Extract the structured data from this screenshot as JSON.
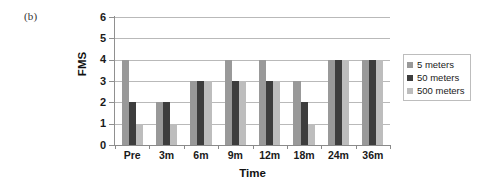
{
  "panel": {
    "label": "(b)"
  },
  "chart_data": {
    "type": "bar",
    "title": "",
    "xlabel": "Time",
    "ylabel": "FMS",
    "categories": [
      "Pre",
      "3m",
      "6m",
      "9m",
      "12m",
      "18m",
      "24m",
      "36m"
    ],
    "series": [
      {
        "name": "5 meters",
        "color": "#999999",
        "values": [
          4,
          2,
          3,
          4,
          4,
          3,
          4,
          4
        ]
      },
      {
        "name": "50 meters",
        "color": "#3d3d3d",
        "values": [
          2,
          2,
          3,
          3,
          3,
          2,
          4,
          4
        ]
      },
      {
        "name": "500 meters",
        "color": "#bdbdbd",
        "values": [
          1,
          1,
          3,
          3,
          3,
          1,
          4,
          4
        ]
      }
    ],
    "ylim": [
      0,
      6
    ],
    "yticks": [
      0,
      1,
      2,
      3,
      4,
      5,
      6
    ],
    "ytick_labels": [
      "0",
      "1",
      "2",
      "3",
      "4",
      "5",
      "6"
    ],
    "grid": true,
    "legend_position": "right"
  }
}
